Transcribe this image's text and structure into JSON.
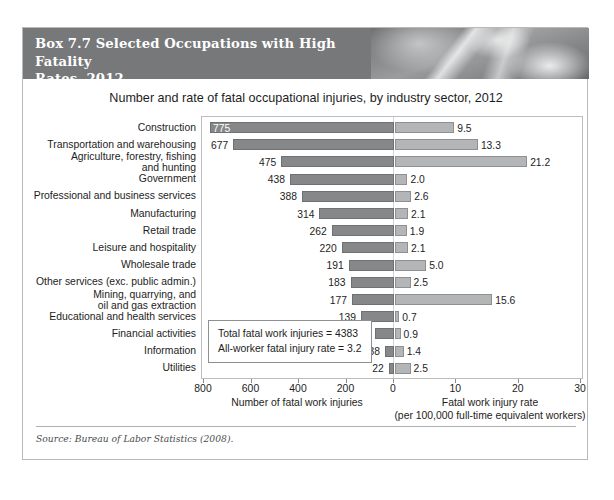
{
  "banner": {
    "title": "Box 7.7   Selected Occupations with High Fatality\nRates, 2012",
    "photo_alt": "header-photograph"
  },
  "chart_title": "Number and rate of fatal occupational injuries, by industry sector, 2012",
  "annotation": {
    "line1": "Total fatal work injuries = 4383",
    "line2": "All-worker fatal injury rate = 3.2"
  },
  "axis_left": {
    "caption": "Number of fatal work injuries",
    "ticks": [
      "800",
      "600",
      "400",
      "200",
      "0"
    ]
  },
  "axis_right": {
    "caption": "Fatal work injury rate\n(per 100,000 full-time equivalent workers)",
    "ticks": [
      "0",
      "10",
      "20",
      "30"
    ]
  },
  "source": "Source: Bureau of Labor Statistics (2008).",
  "colors": {
    "banner": "#76787a",
    "bar_left": "#858789",
    "bar_right": "#b3b5b7",
    "page": "#ffffff",
    "border": "#b9b9b9"
  },
  "chart_data": {
    "type": "bar",
    "orientation": "horizontal-diverging",
    "title": "Number and rate of fatal occupational injuries, by industry sector, 2012",
    "categories": [
      "Construction",
      "Transportation and warehousing",
      "Agriculture, forestry, fishing\nand hunting",
      "Government",
      "Professional and business services",
      "Manufacturing",
      "Retail trade",
      "Leisure and hospitality",
      "Wholesale trade",
      "Other services (exc. public admin.)",
      "Mining, quarrying, and\noil and gas extraction",
      "Educational and health services",
      "Financial activities",
      "Information",
      "Utilities"
    ],
    "series": [
      {
        "name": "Number of fatal work injuries",
        "side": "left",
        "axis_range": [
          0,
          800
        ],
        "axis_reversed": true,
        "values": [
          775,
          677,
          475,
          438,
          388,
          314,
          262,
          220,
          191,
          183,
          177,
          139,
          81,
          38,
          22
        ]
      },
      {
        "name": "Fatal work injury rate (per 100,000 full-time equivalent workers)",
        "side": "right",
        "axis_range": [
          0,
          30
        ],
        "values": [
          9.5,
          13.3,
          21.2,
          2.0,
          2.6,
          2.1,
          1.9,
          2.1,
          5.0,
          2.5,
          15.6,
          0.7,
          0.9,
          1.4,
          2.5
        ]
      }
    ],
    "xlabel_left": "Number of fatal work injuries",
    "xlabel_right": "Fatal work injury rate (per 100,000 full-time equivalent workers)",
    "ylabel": "",
    "grid": false,
    "legend": "none",
    "annotations": [
      "Total fatal work injuries = 4383",
      "All-worker fatal injury rate = 3.2"
    ]
  }
}
